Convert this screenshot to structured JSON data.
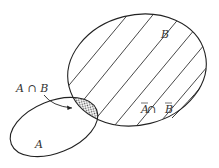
{
  "diagram": {
    "type": "venn",
    "sets": [
      {
        "id": "A",
        "label": "A"
      },
      {
        "id": "B",
        "label": "B"
      }
    ],
    "labels": {
      "set_a": "A",
      "set_b": "B",
      "intersection": "A ∩ B",
      "complement_intersection_a": "A",
      "complement_intersection_op": " ∩ ",
      "complement_intersection_b": "B"
    },
    "regions": [
      {
        "name": "A ∩ B",
        "fill": "dotted"
      },
      {
        "name": "B (excluding A)",
        "fill": "diagonal-hatch"
      }
    ],
    "colors": {
      "stroke": "#222222",
      "background": "#ffffff",
      "dots": "#555555"
    }
  }
}
